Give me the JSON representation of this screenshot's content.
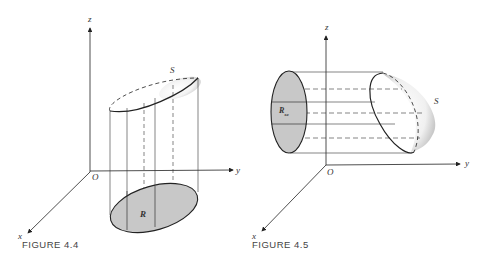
{
  "figures": [
    {
      "caption": "FIGURE 4.4",
      "axes": {
        "z": "z",
        "y": "y",
        "x": "x",
        "origin": "O"
      },
      "surface_label": "S",
      "region_label": "R"
    },
    {
      "caption": "FIGURE 4.5",
      "axes": {
        "z": "z",
        "y": "y",
        "x": "x",
        "origin": "O"
      },
      "surface_label": "S",
      "region_label": "R",
      "region_subscript": "xz"
    }
  ],
  "colors": {
    "shade": "#c8c8c8",
    "line": "#222222"
  }
}
